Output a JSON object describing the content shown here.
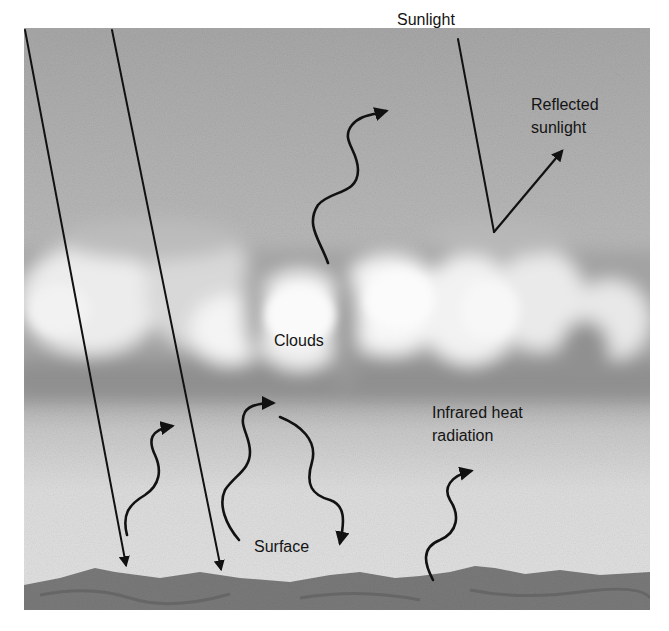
{
  "diagram": {
    "type": "greenhouse-cloud-radiation",
    "labels": {
      "sunlight": "Sunlight",
      "reflected_line1": "Reflected",
      "reflected_line2": "sunlight",
      "clouds": "Clouds",
      "infrared_line1": "Infrared heat",
      "infrared_line2": "radiation",
      "surface": "Surface"
    },
    "colors": {
      "sky_top": "#a9a9a9",
      "sky_mid": "#cfcfcf",
      "cloud_light": "#f2f2f2",
      "cloud_shadow": "#8e8e8e",
      "lower_air": "#dcdcdc",
      "ground": "#7c7c7c",
      "ink": "#111111"
    },
    "arrows": [
      {
        "id": "sunlight-ray-1",
        "kind": "straight",
        "from": [
          25,
          30
        ],
        "to": [
          127,
          568
        ]
      },
      {
        "id": "sunlight-ray-2",
        "kind": "straight",
        "from": [
          112,
          30
        ],
        "to": [
          222,
          572
        ]
      },
      {
        "id": "sunlight-incoming",
        "kind": "line",
        "from": [
          458,
          39
        ],
        "to": [
          494,
          232
        ]
      },
      {
        "id": "reflected-sunlight",
        "kind": "straight",
        "from": [
          494,
          232
        ],
        "to": [
          564,
          148
        ]
      },
      {
        "id": "infrared-escaping",
        "kind": "wavy",
        "from": [
          328,
          263
        ],
        "to": [
          388,
          110
        ]
      },
      {
        "id": "infrared-surface-1",
        "kind": "wavy",
        "from": [
          127,
          535
        ],
        "to": [
          175,
          424
        ]
      },
      {
        "id": "infrared-surface-2",
        "kind": "wavy",
        "from": [
          239,
          540
        ],
        "to": [
          275,
          402
        ]
      },
      {
        "id": "infrared-back-radiated",
        "kind": "wavy",
        "from": [
          280,
          417
        ],
        "to": [
          340,
          545
        ]
      },
      {
        "id": "infrared-surface-3",
        "kind": "wavy",
        "from": [
          433,
          580
        ],
        "to": [
          473,
          470
        ]
      }
    ]
  }
}
